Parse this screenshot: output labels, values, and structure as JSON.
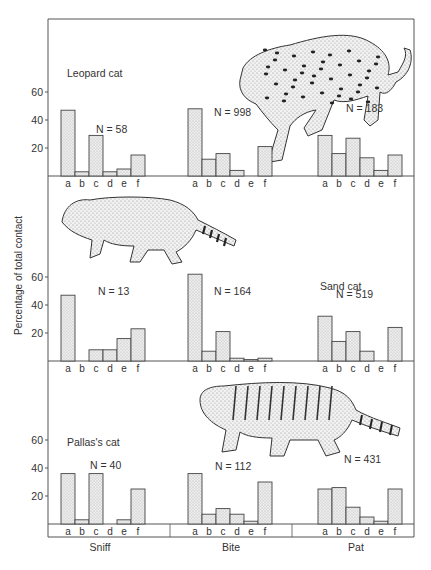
{
  "chart_data": {
    "type": "bar",
    "title": "",
    "ylabel": "Percentage of total contact",
    "xlabel": "",
    "ylim": [
      0,
      70
    ],
    "yticks": [
      20,
      40,
      60
    ],
    "grid": false,
    "groups": [
      "Sniff",
      "Bite",
      "Pat"
    ],
    "categories": [
      "a",
      "b",
      "c",
      "d",
      "e",
      "f"
    ],
    "panels": [
      {
        "species": "Leopard cat",
        "illustration": "leopard-cat-drawing",
        "series": [
          {
            "name": "Sniff",
            "N": "N = 58",
            "values": [
              47,
              3,
              29,
              3,
              5,
              15
            ]
          },
          {
            "name": "Bite",
            "N": "N = 998",
            "values": [
              48,
              12,
              16,
              4,
              0,
              21
            ]
          },
          {
            "name": "Pat",
            "N": "N = 183",
            "values": [
              29,
              16,
              27,
              13,
              4,
              15
            ]
          }
        ]
      },
      {
        "species": "Sand cat",
        "illustration": "sand-cat-drawing",
        "series": [
          {
            "name": "Sniff",
            "N": "N = 13",
            "values": [
              47,
              0,
              8,
              8,
              16,
              23
            ]
          },
          {
            "name": "Bite",
            "N": "N = 164",
            "values": [
              62,
              7,
              21,
              2,
              1,
              2
            ]
          },
          {
            "name": "Pat",
            "N": "N = 519",
            "values": [
              32,
              14,
              21,
              7,
              0,
              24
            ]
          }
        ]
      },
      {
        "species": "Pallas's cat",
        "illustration": "pallas-cat-drawing",
        "series": [
          {
            "name": "Sniff",
            "N": "N = 40",
            "values": [
              36,
              3,
              36,
              0,
              3,
              25
            ]
          },
          {
            "name": "Bite",
            "N": "N = 112",
            "values": [
              36,
              7,
              11,
              7,
              2,
              30
            ]
          },
          {
            "name": "Pat",
            "N": "N = 431",
            "values": [
              25,
              26,
              12,
              5,
              2,
              25
            ]
          }
        ]
      }
    ]
  },
  "labels": {
    "ylabel": "Percentage of total contact",
    "groups": [
      "Sniff",
      "Bite",
      "Pat"
    ]
  },
  "colors": {
    "bar_fill": "#e4e4e4",
    "bar_stroke": "#444444",
    "axis": "#555555",
    "text": "#333333"
  }
}
